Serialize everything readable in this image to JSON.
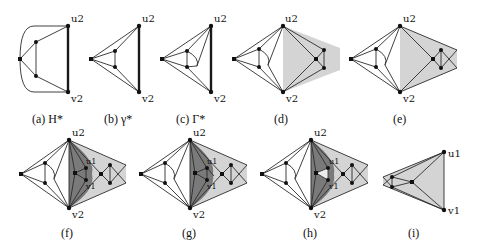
{
  "figure": {
    "panels": [
      {
        "id": "a",
        "caption": "(a) H*",
        "top_label": "u2",
        "bottom_label": "v2"
      },
      {
        "id": "b",
        "caption": "(b) γ*",
        "top_label": "u2",
        "bottom_label": "v2"
      },
      {
        "id": "c",
        "caption": "(c) Γ*",
        "top_label": "u2",
        "bottom_label": "v2"
      },
      {
        "id": "d",
        "caption": "(d)",
        "top_label": "u2",
        "bottom_label": "v2"
      },
      {
        "id": "e",
        "caption": "(e)",
        "top_label": "u2",
        "bottom_label": "v2"
      },
      {
        "id": "f",
        "caption": "(f)",
        "top_label": "u2",
        "bottom_label": "v2",
        "inner_top_label": "u1",
        "inner_bottom_label": "v1"
      },
      {
        "id": "g",
        "caption": "(g)",
        "top_label": "u2",
        "bottom_label": "v2",
        "inner_top_label": "u1",
        "inner_bottom_label": "v1"
      },
      {
        "id": "h",
        "caption": "(h)",
        "top_label": "u2",
        "bottom_label": "v2",
        "inner_top_label": "u1",
        "inner_bottom_label": "v1"
      },
      {
        "id": "i",
        "caption": "(i)",
        "top_label": "u1",
        "bottom_label": "v1"
      }
    ],
    "colors": {
      "light_shade": "#d4d4d4",
      "dark_shade": "#7a7a7a",
      "edge": "#2b2b2b"
    }
  }
}
